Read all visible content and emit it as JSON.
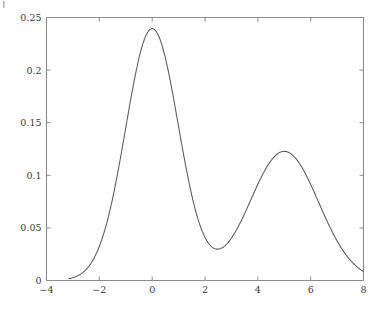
{
  "figure": {
    "name": "bimodal-density-plot",
    "background_color": "#ffffff",
    "axis_color": "#8c8c8c",
    "curve_color": "#5a5a5a",
    "tick_label_color": "#3a3a3a",
    "corner_mark": ""
  },
  "chart_data": {
    "type": "line",
    "title": "",
    "subtitle": "",
    "xlabel": "",
    "ylabel": "",
    "xlim": [
      -4,
      8
    ],
    "ylim": [
      0,
      0.25
    ],
    "grid": false,
    "legend": null,
    "x_ticks": [
      -4,
      -2,
      0,
      2,
      4,
      6,
      8
    ],
    "x_tick_labels": [
      "−4",
      "−2",
      "0",
      "2",
      "4",
      "6",
      "8"
    ],
    "y_ticks": [
      0,
      0.05,
      0.1,
      0.15,
      0.2,
      0.25
    ],
    "y_tick_labels": [
      "0",
      "0.05",
      "0.1",
      "0.15",
      "0.2",
      "0.25"
    ],
    "annotations": [],
    "series": [
      {
        "name": "density",
        "color": "#5a5a5a",
        "line_width": 1.05,
        "model": "gaussian-mixture",
        "components": [
          {
            "weight": 0.6,
            "mean": 0.0,
            "sigma": 1.0
          },
          {
            "weight": 0.4,
            "mean": 5.0,
            "sigma": 1.3
          }
        ],
        "x_start": -3.15,
        "x_end": 8.0,
        "samples": 600,
        "features": {
          "peak1_x": 0.0,
          "peak1_y": 0.2394,
          "peak2_x": 5.0,
          "peak2_y": 0.1578,
          "valley_x": 2.6,
          "valley_y": 0.0175,
          "left_tail_y": 0.0028,
          "right_tail_y": 0.0022
        },
        "x": [
          -3.15,
          -3.0,
          -2.8,
          -2.6,
          -2.4,
          -2.2,
          -2.0,
          -1.8,
          -1.6,
          -1.4,
          -1.2,
          -1.0,
          -0.8,
          -0.6,
          -0.4,
          -0.2,
          0.0,
          0.2,
          0.4,
          0.6,
          0.8,
          1.0,
          1.2,
          1.4,
          1.6,
          1.8,
          2.0,
          2.2,
          2.4,
          2.6,
          2.8,
          3.0,
          3.2,
          3.4,
          3.6,
          3.8,
          4.0,
          4.2,
          4.4,
          4.6,
          4.8,
          5.0,
          5.2,
          5.4,
          5.6,
          5.8,
          6.0,
          6.2,
          6.4,
          6.6,
          6.8,
          7.0,
          7.2,
          7.4,
          7.6,
          7.8,
          8.0
        ],
        "y": [
          0.0028,
          0.0045,
          0.0077,
          0.0126,
          0.0199,
          0.0305,
          0.0449,
          0.0639,
          0.0877,
          0.1158,
          0.1473,
          0.1805,
          0.2131,
          0.2417,
          0.2624,
          0.2721,
          0.2394,
          0.2721,
          0.2624,
          0.2417,
          0.2131,
          0.1805,
          0.1473,
          0.1158,
          0.0877,
          0.0639,
          0.0449,
          0.0305,
          0.0222,
          0.0175,
          0.0182,
          0.0243,
          0.0355,
          0.0512,
          0.0701,
          0.0903,
          0.1097,
          0.1262,
          0.1383,
          0.1479,
          0.1544,
          0.1578,
          0.1544,
          0.1479,
          0.1383,
          0.1262,
          0.1097,
          0.0903,
          0.0701,
          0.0512,
          0.0355,
          0.0243,
          0.0155,
          0.0095,
          0.0057,
          0.0033,
          0.0022
        ]
      }
    ]
  }
}
